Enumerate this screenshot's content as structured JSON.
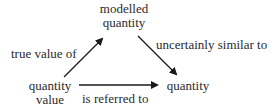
{
  "nodes": {
    "modelled_quantity": {
      "lines": [
        "modelled",
        "quantity"
      ]
    },
    "quantity_value": {
      "lines": [
        "quantity",
        "value"
      ]
    },
    "quantity": {
      "lines": [
        "quantity"
      ]
    }
  },
  "edges": {
    "true_value_of": {
      "label": "true value of",
      "from": "quantity value",
      "to": "modelled quantity"
    },
    "uncertainly_similar_to": {
      "label": "uncertainly similar to",
      "from": "modelled quantity",
      "to": "quantity"
    },
    "is_referred_to": {
      "label": "is referred to",
      "from": "quantity value",
      "to": "quantity"
    }
  },
  "colors": {
    "text": "#2b2b2b",
    "arrow": "#1a1a1a",
    "background": "#ffffff"
  }
}
